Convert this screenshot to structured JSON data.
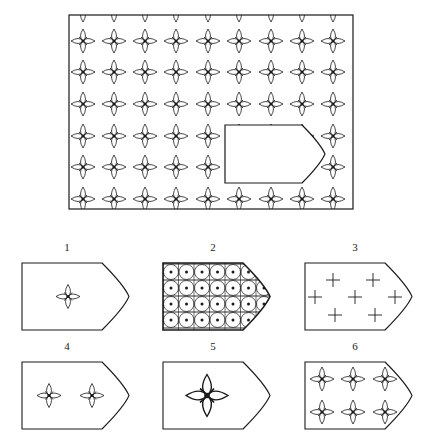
{
  "puzzle": {
    "type": "pattern-completion",
    "main_panel": {
      "frame": {
        "x": 69,
        "y": 15,
        "w": 284,
        "h": 194
      },
      "pattern": "four-petal-star",
      "grid": {
        "cols_x": [
          83,
          114,
          145,
          176,
          208,
          239,
          271,
          302,
          333
        ],
        "rows_y": [
          41,
          72,
          104,
          136,
          167,
          199
        ],
        "top_partial_row_y": 10
      },
      "missing_region": {
        "x": 225,
        "y": 125,
        "flat_w": 77,
        "tip_x": 325,
        "h": 58
      }
    },
    "options": [
      {
        "label": "1",
        "description": "single small star, centered"
      },
      {
        "label": "2",
        "description": "dense grid of circles with dots"
      },
      {
        "label": "3",
        "description": "seven plus signs"
      },
      {
        "label": "4",
        "description": "two small stars"
      },
      {
        "label": "5",
        "description": "single large star"
      },
      {
        "label": "6",
        "description": "six stars in 2x3 grid"
      }
    ],
    "colors": {
      "stroke": "#1a1a1a",
      "background": "#ffffff"
    }
  }
}
